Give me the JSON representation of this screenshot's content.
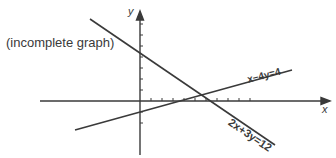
{
  "diagram": {
    "note": "(incomplete graph)",
    "axes": {
      "x_label": "x",
      "y_label": "y"
    },
    "lines": [
      {
        "equation": "2x+3y=12",
        "y_intercept": 4,
        "x_intercept": 6
      },
      {
        "equation": "x−4y=4",
        "y_intercept": -1,
        "x_intercept": 4
      }
    ],
    "colors": {
      "line": "#3a3a3a",
      "background": "#ffffff"
    }
  }
}
